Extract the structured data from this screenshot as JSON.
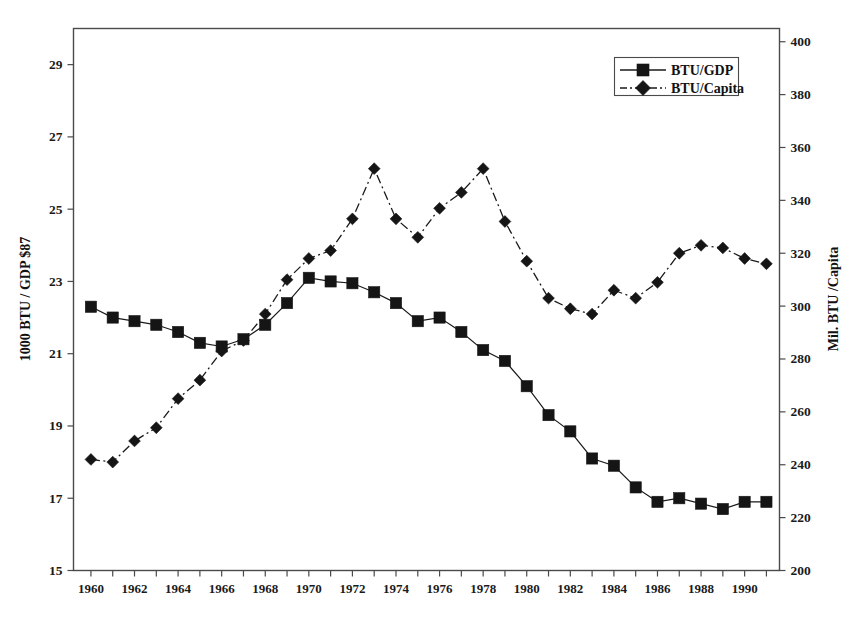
{
  "chart_data": {
    "type": "line",
    "title": "",
    "subtitle": "",
    "xlabel": "",
    "ylabel": "1000 BTU / GDP $87",
    "y2label": "Mil. BTU /Capita",
    "grid": false,
    "legend_position": "top-right",
    "xlim": [
      1959.2,
      1991.6
    ],
    "ylim": [
      15,
      30
    ],
    "y2lim": [
      200,
      405
    ],
    "x": [
      1960,
      1961,
      1962,
      1963,
      1964,
      1965,
      1966,
      1967,
      1968,
      1969,
      1970,
      1971,
      1972,
      1973,
      1974,
      1975,
      1976,
      1977,
      1978,
      1979,
      1980,
      1981,
      1982,
      1983,
      1984,
      1985,
      1986,
      1987,
      1988,
      1989,
      1990,
      1991
    ],
    "xticks_major": [
      1960,
      1962,
      1964,
      1966,
      1968,
      1970,
      1972,
      1974,
      1976,
      1978,
      1980,
      1982,
      1984,
      1986,
      1988,
      1990
    ],
    "xtick_labels": [
      "1960",
      "1962",
      "1964",
      "1966",
      "1968",
      "1970",
      "1972",
      "1974",
      "1976",
      "1978",
      "1980",
      "1982",
      "1984",
      "1986",
      "1988",
      "1990"
    ],
    "yticks": [
      15,
      17,
      19,
      21,
      23,
      25,
      27,
      29
    ],
    "ytick_labels": [
      "15",
      "17",
      "19",
      "21",
      "23",
      "25",
      "27",
      "29"
    ],
    "y2ticks": [
      200,
      220,
      240,
      260,
      280,
      300,
      320,
      340,
      360,
      380,
      400
    ],
    "y2tick_labels": [
      "200",
      "220",
      "240",
      "260",
      "280",
      "300",
      "320",
      "340",
      "360",
      "380",
      "400"
    ],
    "series": [
      {
        "name": "BTU/GDP",
        "axis": "left",
        "marker": "square",
        "linestyle": "solid",
        "color": "#151515",
        "values": [
          22.3,
          22.0,
          21.9,
          21.8,
          21.6,
          21.3,
          21.2,
          21.4,
          21.8,
          22.4,
          23.1,
          23.0,
          22.95,
          22.7,
          22.4,
          21.9,
          22.0,
          21.6,
          21.1,
          20.8,
          20.1,
          19.3,
          18.85,
          18.1,
          17.9,
          17.3,
          16.9,
          17.0,
          16.85,
          16.7,
          16.9,
          16.9
        ]
      },
      {
        "name": "BTU/Capita",
        "axis": "right",
        "marker": "diamond",
        "linestyle": "dashdot",
        "color": "#151515",
        "values": [
          242,
          241,
          249,
          254,
          265,
          272,
          283,
          287,
          297,
          310,
          318,
          321,
          333,
          352,
          333,
          326,
          337,
          343,
          352,
          332,
          317,
          303,
          299,
          297,
          306,
          303,
          309,
          320,
          323,
          322,
          318,
          316
        ]
      }
    ],
    "legend": [
      {
        "label": "BTU/GDP",
        "marker": "square",
        "linestyle": "solid"
      },
      {
        "label": "BTU/Capita",
        "marker": "diamond",
        "linestyle": "dashdot"
      }
    ],
    "colors": {
      "ink": "#151515",
      "frame": "#4a4a4a",
      "background": "#ffffff"
    }
  }
}
